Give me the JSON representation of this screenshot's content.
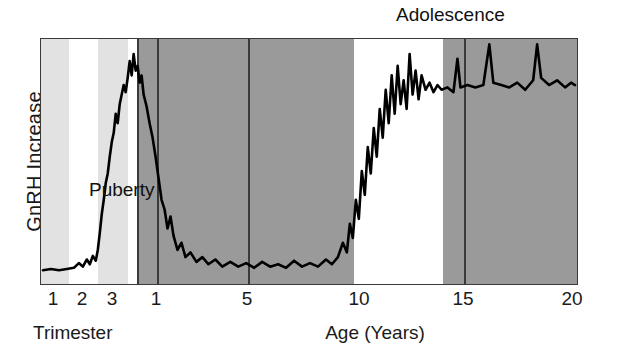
{
  "chart_data": {
    "type": "line",
    "title": "",
    "xlabel": "Age (Years)",
    "secondary_xlabel": "Trimester",
    "ylabel": "GnRH Increase",
    "grid": true,
    "legend": "none",
    "annotations": [
      {
        "text": "Adolescence",
        "x": 11.7,
        "position": "above-plot"
      },
      {
        "text": "Puberty",
        "x": 11.2,
        "position": "in-plot"
      }
    ],
    "x_ticks_trimester": [
      {
        "label": "1",
        "pos_px": 53
      },
      {
        "label": "2",
        "pos_px": 82
      },
      {
        "label": "3",
        "pos_px": 112
      }
    ],
    "x_ticks_age": [
      {
        "label": "1",
        "pos_px": 156
      },
      {
        "label": "5",
        "pos_px": 247
      },
      {
        "label": "10",
        "pos_px": 359
      },
      {
        "label": "15",
        "pos_px": 463
      },
      {
        "label": "20",
        "pos_px": 572
      }
    ],
    "bands": [
      {
        "name": "first-trimester",
        "color": "#e2e2e2",
        "x0_px": 0,
        "x1_px": 28
      },
      {
        "name": "second-trimester",
        "color": "#ffffff",
        "x0_px": 28,
        "x1_px": 57
      },
      {
        "name": "third-trimester",
        "color": "#e2e2e2",
        "x0_px": 57,
        "x1_px": 87
      },
      {
        "name": "birth-gap",
        "color": "#ffffff",
        "x0_px": 87,
        "x1_px": 96
      },
      {
        "name": "childhood",
        "color": "#9a9a9a",
        "x0_px": 96,
        "x1_px": 313
      },
      {
        "name": "puberty",
        "color": "#ffffff",
        "x0_px": 313,
        "x1_px": 402
      },
      {
        "name": "adulthood",
        "color": "#9a9a9a",
        "x0_px": 402,
        "x1_px": 538
      }
    ],
    "gridlines_px": [
      96,
      116,
      207,
      423
    ],
    "series": [
      {
        "name": "GnRH pulse amplitude",
        "ylim": [
          0,
          1
        ],
        "values": [
          {
            "x_px": 2,
            "y": 0.045
          },
          {
            "x_px": 10,
            "y": 0.05
          },
          {
            "x_px": 18,
            "y": 0.045
          },
          {
            "x_px": 26,
            "y": 0.05
          },
          {
            "x_px": 33,
            "y": 0.055
          },
          {
            "x_px": 38,
            "y": 0.075
          },
          {
            "x_px": 42,
            "y": 0.06
          },
          {
            "x_px": 46,
            "y": 0.09
          },
          {
            "x_px": 49,
            "y": 0.07
          },
          {
            "x_px": 52,
            "y": 0.105
          },
          {
            "x_px": 55,
            "y": 0.085
          },
          {
            "x_px": 57,
            "y": 0.13
          },
          {
            "x_px": 59,
            "y": 0.2
          },
          {
            "x_px": 61,
            "y": 0.28
          },
          {
            "x_px": 63,
            "y": 0.34
          },
          {
            "x_px": 65,
            "y": 0.41
          },
          {
            "x_px": 67,
            "y": 0.45
          },
          {
            "x_px": 69,
            "y": 0.52
          },
          {
            "x_px": 71,
            "y": 0.58
          },
          {
            "x_px": 73,
            "y": 0.62
          },
          {
            "x_px": 75,
            "y": 0.7
          },
          {
            "x_px": 77,
            "y": 0.66
          },
          {
            "x_px": 79,
            "y": 0.74
          },
          {
            "x_px": 81,
            "y": 0.78
          },
          {
            "x_px": 83,
            "y": 0.82
          },
          {
            "x_px": 85,
            "y": 0.79
          },
          {
            "x_px": 87,
            "y": 0.85
          },
          {
            "x_px": 89,
            "y": 0.92
          },
          {
            "x_px": 91,
            "y": 0.86
          },
          {
            "x_px": 93,
            "y": 0.95
          },
          {
            "x_px": 95,
            "y": 0.88
          },
          {
            "x_px": 97,
            "y": 0.9
          },
          {
            "x_px": 99,
            "y": 0.83
          },
          {
            "x_px": 101,
            "y": 0.86
          },
          {
            "x_px": 103,
            "y": 0.78
          },
          {
            "x_px": 106,
            "y": 0.73
          },
          {
            "x_px": 109,
            "y": 0.66
          },
          {
            "x_px": 112,
            "y": 0.6
          },
          {
            "x_px": 115,
            "y": 0.52
          },
          {
            "x_px": 118,
            "y": 0.43
          },
          {
            "x_px": 121,
            "y": 0.34
          },
          {
            "x_px": 124,
            "y": 0.3
          },
          {
            "x_px": 127,
            "y": 0.22
          },
          {
            "x_px": 130,
            "y": 0.27
          },
          {
            "x_px": 133,
            "y": 0.19
          },
          {
            "x_px": 137,
            "y": 0.13
          },
          {
            "x_px": 141,
            "y": 0.16
          },
          {
            "x_px": 145,
            "y": 0.1
          },
          {
            "x_px": 150,
            "y": 0.12
          },
          {
            "x_px": 156,
            "y": 0.08
          },
          {
            "x_px": 162,
            "y": 0.1
          },
          {
            "x_px": 168,
            "y": 0.07
          },
          {
            "x_px": 175,
            "y": 0.09
          },
          {
            "x_px": 182,
            "y": 0.06
          },
          {
            "x_px": 190,
            "y": 0.08
          },
          {
            "x_px": 198,
            "y": 0.06
          },
          {
            "x_px": 206,
            "y": 0.075
          },
          {
            "x_px": 214,
            "y": 0.055
          },
          {
            "x_px": 222,
            "y": 0.08
          },
          {
            "x_px": 230,
            "y": 0.06
          },
          {
            "x_px": 238,
            "y": 0.07
          },
          {
            "x_px": 246,
            "y": 0.055
          },
          {
            "x_px": 254,
            "y": 0.085
          },
          {
            "x_px": 262,
            "y": 0.06
          },
          {
            "x_px": 270,
            "y": 0.075
          },
          {
            "x_px": 278,
            "y": 0.06
          },
          {
            "x_px": 286,
            "y": 0.09
          },
          {
            "x_px": 292,
            "y": 0.07
          },
          {
            "x_px": 298,
            "y": 0.1
          },
          {
            "x_px": 303,
            "y": 0.16
          },
          {
            "x_px": 307,
            "y": 0.12
          },
          {
            "x_px": 310,
            "y": 0.24
          },
          {
            "x_px": 313,
            "y": 0.18
          },
          {
            "x_px": 316,
            "y": 0.34
          },
          {
            "x_px": 319,
            "y": 0.26
          },
          {
            "x_px": 322,
            "y": 0.46
          },
          {
            "x_px": 325,
            "y": 0.36
          },
          {
            "x_px": 328,
            "y": 0.56
          },
          {
            "x_px": 331,
            "y": 0.45
          },
          {
            "x_px": 334,
            "y": 0.64
          },
          {
            "x_px": 337,
            "y": 0.52
          },
          {
            "x_px": 340,
            "y": 0.72
          },
          {
            "x_px": 343,
            "y": 0.6
          },
          {
            "x_px": 346,
            "y": 0.8
          },
          {
            "x_px": 349,
            "y": 0.66
          },
          {
            "x_px": 352,
            "y": 0.86
          },
          {
            "x_px": 355,
            "y": 0.7
          },
          {
            "x_px": 358,
            "y": 0.9
          },
          {
            "x_px": 361,
            "y": 0.74
          },
          {
            "x_px": 364,
            "y": 0.84
          },
          {
            "x_px": 367,
            "y": 0.72
          },
          {
            "x_px": 370,
            "y": 0.95
          },
          {
            "x_px": 373,
            "y": 0.78
          },
          {
            "x_px": 376,
            "y": 0.88
          },
          {
            "x_px": 379,
            "y": 0.76
          },
          {
            "x_px": 382,
            "y": 0.86
          },
          {
            "x_px": 386,
            "y": 0.8
          },
          {
            "x_px": 390,
            "y": 0.83
          },
          {
            "x_px": 394,
            "y": 0.79
          },
          {
            "x_px": 398,
            "y": 0.82
          },
          {
            "x_px": 402,
            "y": 0.8
          },
          {
            "x_px": 408,
            "y": 0.81
          },
          {
            "x_px": 414,
            "y": 0.79
          },
          {
            "x_px": 418,
            "y": 0.93
          },
          {
            "x_px": 421,
            "y": 0.81
          },
          {
            "x_px": 428,
            "y": 0.82
          },
          {
            "x_px": 436,
            "y": 0.81
          },
          {
            "x_px": 444,
            "y": 0.82
          },
          {
            "x_px": 450,
            "y": 0.99
          },
          {
            "x_px": 454,
            "y": 0.83
          },
          {
            "x_px": 462,
            "y": 0.82
          },
          {
            "x_px": 470,
            "y": 0.81
          },
          {
            "x_px": 478,
            "y": 0.83
          },
          {
            "x_px": 486,
            "y": 0.8
          },
          {
            "x_px": 494,
            "y": 0.84
          },
          {
            "x_px": 498,
            "y": 0.99
          },
          {
            "x_px": 502,
            "y": 0.85
          },
          {
            "x_px": 510,
            "y": 0.82
          },
          {
            "x_px": 518,
            "y": 0.84
          },
          {
            "x_px": 526,
            "y": 0.81
          },
          {
            "x_px": 532,
            "y": 0.83
          },
          {
            "x_px": 536,
            "y": 0.82
          }
        ]
      }
    ]
  }
}
